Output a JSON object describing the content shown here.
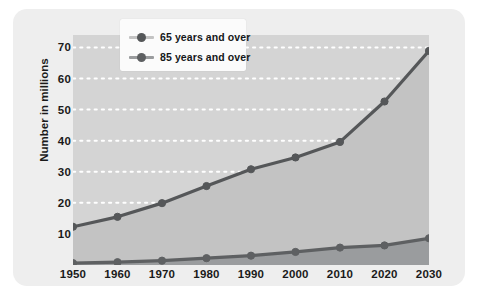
{
  "chart_data": {
    "type": "line",
    "title": "",
    "subtitle": "",
    "xlabel": "",
    "ylabel": "Number in millions",
    "x": [
      1950,
      1960,
      1970,
      1980,
      1990,
      2000,
      2010,
      2020,
      2030
    ],
    "xtick_labels": [
      "1950",
      "1960",
      "1970",
      "1980",
      "1990",
      "2000",
      "2010",
      "2020",
      "2030"
    ],
    "ytick_labels": [
      "10",
      "20",
      "30",
      "40",
      "50",
      "60",
      "70"
    ],
    "yticks": [
      10,
      20,
      30,
      40,
      50,
      60,
      70
    ],
    "ylim": [
      0,
      74
    ],
    "xlim": [
      1950,
      2030
    ],
    "grid": "horizontal-dotted-white",
    "legend_position": "top-left-inside",
    "series": [
      {
        "name": "65 years and over",
        "values": [
          12.3,
          15.5,
          19.9,
          25.4,
          30.8,
          34.6,
          39.6,
          52.6,
          68.9
        ],
        "color": "#555759",
        "fill": "#c3c3c3",
        "marker": "circle"
      },
      {
        "name": "85 years and over",
        "values": [
          0.6,
          0.9,
          1.4,
          2.2,
          3.0,
          4.2,
          5.6,
          6.3,
          8.6
        ],
        "color": "#5e6062",
        "fill": "#9a9c9e",
        "marker": "circle"
      }
    ]
  },
  "legend": {
    "items": [
      {
        "label": "65 years and over"
      },
      {
        "label": "85 years and over"
      }
    ]
  },
  "axes": {
    "y_title": "Number in millions"
  },
  "colors": {
    "card_background": "#eeeeee",
    "plot_background": "#d4d4d4",
    "area_65_plus": "#c3c3c3",
    "area_85_plus": "#9a9c9e",
    "line_65_plus": "#555759",
    "line_85_plus": "#5e6062",
    "gridline": "#ffffff",
    "text": "#1a1a1a",
    "legend_background": "#fbfbfb"
  }
}
